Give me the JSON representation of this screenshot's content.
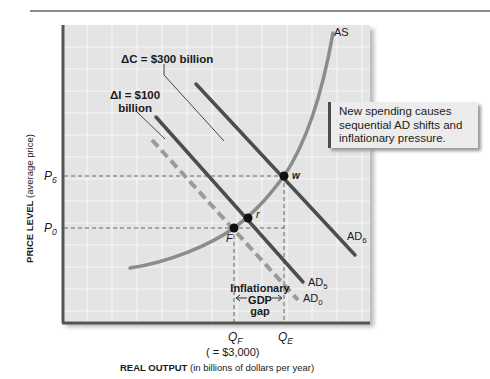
{
  "figure": {
    "type": "aggregate-supply-aggregate-demand-diagram",
    "axes": {
      "y_title_bold": "PRICE LEVEL",
      "y_title_rest": " (average price)",
      "x_title_bold": "REAL OUTPUT",
      "x_title_rest": " (in billions of dollars per year)"
    },
    "y_ticks": [
      {
        "letter": "P",
        "sub": "6"
      },
      {
        "letter": "P",
        "sub": "0"
      }
    ],
    "x_ticks": [
      {
        "letter": "Q",
        "sub": "F",
        "note": "( = $3,000)"
      },
      {
        "letter": "Q",
        "sub": "E"
      }
    ],
    "curves": {
      "as": {
        "label": "AS",
        "color": "#8c8c8c"
      },
      "ad0": {
        "label": "AD",
        "sub": "0",
        "color": "#9a9a9a",
        "style": "dashed"
      },
      "ad5": {
        "label": "AD",
        "sub": "5",
        "color": "#4d4d4d"
      },
      "ad6": {
        "label": "AD",
        "sub": "6",
        "color": "#4d4d4d"
      }
    },
    "points": [
      {
        "name": "F"
      },
      {
        "name": "r"
      },
      {
        "name": "w"
      }
    ],
    "annotations": {
      "delta_c": "ΔC = $300 billion",
      "delta_i_line1": "ΔI = $100",
      "delta_i_line2": "billion",
      "gap_line1": "Inflationary",
      "gap_line2": "GDP",
      "gap_line3": "gap",
      "callout": "New spending causes sequential AD shifts and inflationary pressure."
    }
  }
}
